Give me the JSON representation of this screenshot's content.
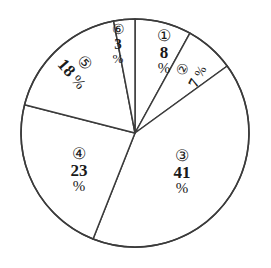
{
  "chart_data": {
    "type": "pie",
    "title": "",
    "subtitle": "",
    "xlabel": "",
    "ylabel": "",
    "legend": "none",
    "grid": false,
    "units": "%",
    "total": 100,
    "start_angle_deg": 0,
    "direction": "clockwise",
    "categories": [
      "①",
      "②",
      "③",
      "④",
      "⑤",
      "⑥"
    ],
    "values": [
      8,
      7,
      41,
      23,
      18,
      3
    ],
    "slices": [
      {
        "id": "①",
        "value": "8",
        "percent": "%",
        "start_deg": 0,
        "end_deg": 28.8
      },
      {
        "id": "②",
        "value": "7",
        "percent": "%",
        "start_deg": 28.8,
        "end_deg": 54.0
      },
      {
        "id": "③",
        "value": "41",
        "percent": "%",
        "start_deg": 54.0,
        "end_deg": 201.6
      },
      {
        "id": "④",
        "value": "23",
        "percent": "%",
        "start_deg": 201.6,
        "end_deg": 284.4
      },
      {
        "id": "⑤",
        "value": "18",
        "percent": "%",
        "start_deg": 284.4,
        "end_deg": 349.2
      },
      {
        "id": "⑥",
        "value": "3",
        "percent": "%",
        "start_deg": 349.2,
        "end_deg": 360.0
      }
    ],
    "colors": {
      "background": "#ffffff",
      "slice_fill": "#ffffff",
      "outline": "#3b3b3b",
      "text": "#1a1a1a"
    },
    "geometry": {
      "cx": 135,
      "cy": 133,
      "r": 114
    }
  }
}
